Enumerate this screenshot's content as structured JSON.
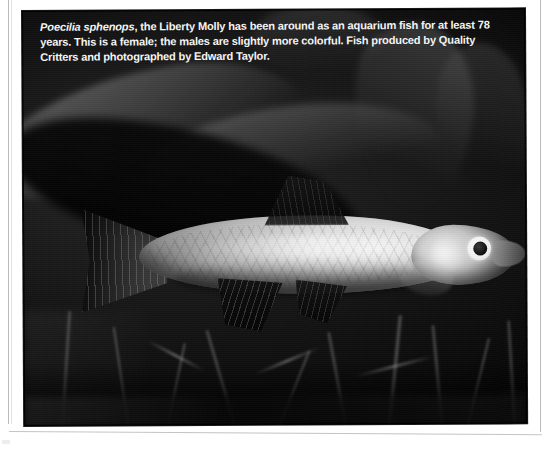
{
  "page": {
    "background_color": "#ffffff",
    "type": "scanned-book-page"
  },
  "plate": {
    "name": "liberty-molly-photograph",
    "background_color": "#000000",
    "subject": "aquarium fish photograph",
    "orientation": "landscape"
  },
  "caption": {
    "scientific_name": "Poecilia sphenops",
    "rest_line1": ", the Liberty Molly has been around as an aquarium fish for at least",
    "line2": "78 years. This is a female; the males are slightly more colorful. Fish produced by Quality",
    "line3": "Critters and photographed by Edward Taylor.",
    "text_color": "#f4f4f4",
    "full_text": "Poecilia sphenops, the Liberty Molly has been around as an aquarium fish for at least 78 years. This is a female; the males are slightly more colorful. Fish produced by Quality Critters and photographed by Edward Taylor."
  },
  "photo_content": {
    "subject_common_name": "Liberty Molly",
    "subject_sex": "female",
    "fish_body_color": "#dcdcdc",
    "fin_color": "#0e0e0e",
    "eye_ring_color": "#ffffff",
    "eye_pupil_color": "#0a0a0a",
    "background_description": "dark planted aquarium with broad leaves and stems"
  }
}
